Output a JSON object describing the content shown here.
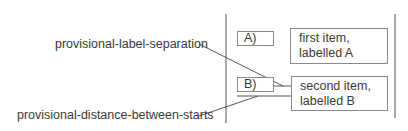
{
  "diagram": {
    "callouts": {
      "label_separation": "provisional-label-separation",
      "distance_between_starts": "provisional-distance-between-starts"
    },
    "items": [
      {
        "label": "A)",
        "body_line1": "first item,",
        "body_line2": "labelled A"
      },
      {
        "label": "B)",
        "body_line1": "second item,",
        "body_line2": "labelled B"
      }
    ],
    "colors": {
      "line": "#555555",
      "box_border": "#8a8a8a",
      "text": "#3a3a3a"
    }
  }
}
